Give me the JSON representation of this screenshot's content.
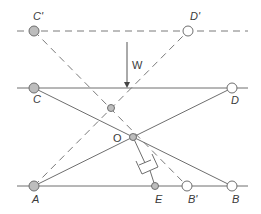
{
  "diagram": {
    "type": "mechanism-geometry",
    "colors": {
      "line": "#6e6e6e",
      "filled_pivot": "#bdbdbd",
      "open_pivot": "#ffffff",
      "label": "#3a3a3a"
    },
    "labels": {
      "C_prime": "C'",
      "D_prime": "D'",
      "W": "W",
      "C": "C",
      "D": "D",
      "O": "O",
      "A": "A",
      "E": "E",
      "B_prime": "B'",
      "B": "B"
    },
    "points": {
      "C_prime": {
        "x": 34,
        "y": 31,
        "style": "filled"
      },
      "D_prime": {
        "x": 188,
        "y": 31,
        "style": "open"
      },
      "C": {
        "x": 34,
        "y": 88,
        "style": "filled"
      },
      "D": {
        "x": 232,
        "y": 88,
        "style": "open"
      },
      "P_mid": {
        "x": 111,
        "y": 108,
        "style": "filled"
      },
      "O": {
        "x": 133,
        "y": 137,
        "style": "filled"
      },
      "A": {
        "x": 34,
        "y": 186,
        "style": "filled"
      },
      "E": {
        "x": 155,
        "y": 186,
        "style": "filled"
      },
      "B_prime": {
        "x": 187,
        "y": 186,
        "style": "open"
      },
      "B": {
        "x": 232,
        "y": 186,
        "style": "open"
      }
    },
    "lines": [
      {
        "from": "top_left_end",
        "to": "top_right_end",
        "style": "dashed",
        "name": "displaced-top-line"
      },
      {
        "from": "C_prime",
        "to": "B_prime",
        "style": "dashed"
      },
      {
        "from": "A",
        "to": "D_prime",
        "style": "dashed"
      },
      {
        "from": "middle_left_end",
        "to": "middle_right_end",
        "style": "solid",
        "name": "top-line"
      },
      {
        "from": "C",
        "to": "B",
        "style": "solid"
      },
      {
        "from": "A",
        "to": "D",
        "style": "solid"
      },
      {
        "from": "bottom_left_end",
        "to": "bottom_right_end",
        "style": "solid",
        "name": "base-line"
      }
    ],
    "load_arrow": {
      "label": "W",
      "x": 127,
      "y_start": 42,
      "y_end": 88,
      "direction": "down"
    },
    "damper": {
      "from": "O",
      "to": "E",
      "description": "dashpot between O and E"
    }
  }
}
